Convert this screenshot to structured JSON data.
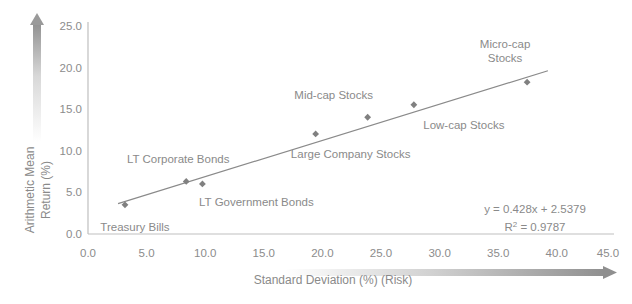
{
  "chart_data": {
    "type": "scatter",
    "title": "",
    "xlabel": "Standard Deviation (%) (Risk)",
    "ylabel": "Arithmetic Mean Return (%)",
    "xlim": [
      0.0,
      45.0
    ],
    "ylim": [
      0.0,
      25.0
    ],
    "xticks": [
      "0.0",
      "5.0",
      "10.0",
      "15.0",
      "20.0",
      "25.0",
      "30.0",
      "35.0",
      "40.0",
      "45.0"
    ],
    "yticks": [
      "0.0",
      "5.0",
      "10.0",
      "15.0",
      "20.0",
      "25.0"
    ],
    "grid": false,
    "legend": "none",
    "marker_color": "#808080",
    "trendline_color": "#8a8a8a",
    "axis_color": "#bfbfbf",
    "text_color": "#8a8a8a",
    "points": [
      {
        "label": "Treasury Bills",
        "x": 3.2,
        "y": 3.5,
        "label_dx": 10,
        "label_dy": 26,
        "label_anchor": "middle"
      },
      {
        "label": "LT Corporate Bonds",
        "x": 8.5,
        "y": 6.3,
        "label_dx": -8,
        "label_dy": -18,
        "label_anchor": "middle"
      },
      {
        "label": "LT Government Bonds",
        "x": 9.9,
        "y": 6.0,
        "label_dx": 54,
        "label_dy": 22,
        "label_anchor": "middle"
      },
      {
        "label": "Large Company Stocks",
        "x": 19.7,
        "y": 12.0,
        "label_dx": 35,
        "label_dy": 24,
        "label_anchor": "middle"
      },
      {
        "label": "Mid-cap Stocks",
        "x": 24.2,
        "y": 14.0,
        "label_dx": -34,
        "label_dy": -18,
        "label_anchor": "middle"
      },
      {
        "label": "Low-cap Stocks",
        "x": 28.2,
        "y": 15.5,
        "label_dx": 50,
        "label_dy": 24,
        "label_anchor": "middle"
      },
      {
        "label": "Micro-cap Stocks",
        "x": 38.0,
        "y": 18.2,
        "label_dx": -22,
        "label_dy": -34,
        "label_anchor": "middle"
      }
    ],
    "trendline": {
      "slope": 0.428,
      "intercept": 2.5379,
      "x_start": 2.6,
      "x_end": 39.8
    },
    "annotations": {
      "equation": "y = 0.428x + 2.5379",
      "r_squared_prefix": "R",
      "r_squared_sup": "2",
      "r_squared_value": " = 0.9787"
    },
    "arrows": {
      "y_axis_arrow": "up-gradient-arrow",
      "x_axis_arrow": "right-gradient-arrow"
    }
  }
}
